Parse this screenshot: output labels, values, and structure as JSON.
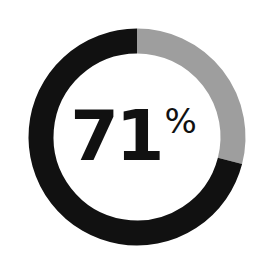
{
  "chart_data": {
    "type": "pie",
    "variant": "donut",
    "title": "",
    "categories": [
      "Filled",
      "Remaining"
    ],
    "values": [
      71,
      29
    ],
    "colors": [
      "#111111",
      "#9e9e9e"
    ],
    "center_label": {
      "value": "71",
      "unit": "%"
    },
    "start_angle": "12 o'clock",
    "direction": "counterclockwise for filled segment (remaining segment clockwise from top)",
    "legend": "none"
  },
  "label": {
    "value": "71",
    "unit": "%"
  },
  "colors": {
    "filled": "#111111",
    "remaining": "#9e9e9e",
    "background": "#ffffff"
  }
}
